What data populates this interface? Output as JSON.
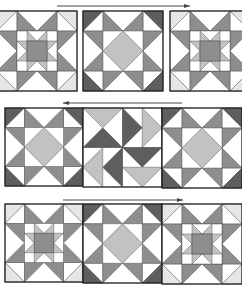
{
  "colors": {
    "white": "#ffffff",
    "pale": "#e6e6e6",
    "light": "#c2c2c2",
    "medium": "#8e8e8e",
    "dark": "#5e5e5e",
    "outline": "#1e1e1e",
    "arrow": "#444444"
  },
  "rows": [
    {
      "name": "row-top",
      "arrow": {
        "x1": 57,
        "x2": 190,
        "y": 6,
        "direction": "right"
      },
      "blocks": [
        {
          "type": "star-in-star",
          "x": -3,
          "y": 11,
          "size": 80
        },
        {
          "type": "ohio-star",
          "x": 83,
          "y": 11,
          "size": 80
        },
        {
          "type": "star-in-star",
          "x": 170,
          "y": 11,
          "size": 80
        }
      ]
    },
    {
      "name": "row-middle",
      "arrow": {
        "x1": 63,
        "x2": 182,
        "y": 103,
        "direction": "left"
      },
      "blocks": [
        {
          "type": "ohio-star",
          "x": 5,
          "y": 108,
          "size": 78
        },
        {
          "type": "pinwheel",
          "x": 83,
          "y": 108,
          "size": 79
        },
        {
          "type": "ohio-star",
          "x": 162,
          "y": 108,
          "size": 80
        }
      ]
    },
    {
      "name": "row-bottom",
      "arrow": {
        "x1": 63,
        "x2": 183,
        "y": 200,
        "direction": "right"
      },
      "blocks": [
        {
          "type": "star-in-star",
          "x": 5,
          "y": 204,
          "size": 78
        },
        {
          "type": "ohio-star",
          "x": 83,
          "y": 204,
          "size": 79
        },
        {
          "type": "star-in-star",
          "x": 162,
          "y": 204,
          "size": 80
        }
      ]
    }
  ]
}
